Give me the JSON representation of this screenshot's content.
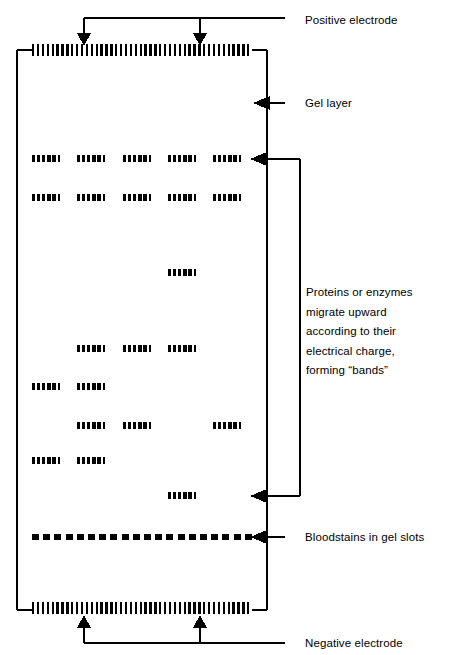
{
  "figure": {
    "type": "gel-electrophoresis-diagram",
    "background": "#ffffff",
    "ink": "#000000",
    "width": 452,
    "height": 655
  },
  "gel": {
    "box": {
      "x": 16,
      "y": 48,
      "width": 252,
      "height": 564
    },
    "lanes_x": [
      32,
      77,
      123,
      168,
      213
    ],
    "lane_width": 28,
    "band_height": 7,
    "band_rows": [
      {
        "y": 158,
        "lanes": [
          1,
          2,
          3,
          4,
          5
        ]
      },
      {
        "y": 197,
        "lanes": [
          1,
          2,
          3,
          4,
          5
        ]
      },
      {
        "y": 272,
        "lanes": [
          4
        ]
      },
      {
        "y": 348,
        "lanes": [
          2,
          3,
          4
        ]
      },
      {
        "y": 386,
        "lanes": [
          1,
          2
        ]
      },
      {
        "y": 425,
        "lanes": [
          2,
          3,
          5
        ]
      },
      {
        "y": 460,
        "lanes": [
          1,
          2
        ]
      },
      {
        "y": 495,
        "lanes": [
          4
        ]
      }
    ],
    "slot_row_y": 537,
    "electrode_teeth": 45
  },
  "labels": {
    "positive_electrode": "Positive electrode",
    "gel_layer": "Gel layer",
    "bands_note": "Proteins or enzymes migrate upward according to their electrical charge, forming “bands”",
    "bloodstains": "Bloodstains in gel slots",
    "negative_electrode": "Negative electrode"
  }
}
